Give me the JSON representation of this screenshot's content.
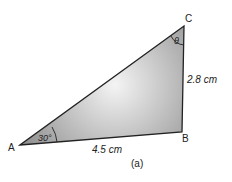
{
  "figure": {
    "caption": "(a)",
    "vertices": {
      "A": "A",
      "B": "B",
      "C": "C"
    },
    "sides": {
      "AB": "4.5 cm",
      "BC": "2.8 cm"
    },
    "angles": {
      "A": "30°",
      "C": "θ"
    },
    "colors": {
      "fill_dark": "#9a9a9a",
      "fill_light": "#f2f2f2",
      "stroke": "#222222"
    }
  }
}
